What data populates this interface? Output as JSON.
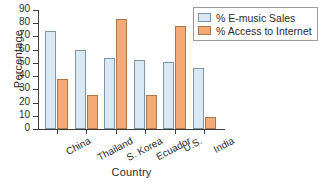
{
  "chart_data": {
    "type": "bar",
    "title": "",
    "xlabel": "Country",
    "ylabel": "Percentage",
    "categories": [
      "China",
      "Thailand",
      "S. Korea",
      "Ecuador",
      "U.S.",
      "India"
    ],
    "series": [
      {
        "name": "% E-music Sales",
        "color": "#d9e8f2",
        "edge_color": "#7d94a3",
        "values": [
          74,
          60,
          54,
          52,
          51,
          46
        ]
      },
      {
        "name": "% Access to Internet",
        "color": "#f2ab77",
        "edge_color": "#b0764a",
        "values": [
          38,
          26,
          83,
          26,
          78,
          9
        ]
      }
    ],
    "ylim": [
      0,
      90
    ],
    "yticks": [
      0,
      10,
      20,
      30,
      40,
      50,
      60,
      70,
      80,
      90
    ],
    "ytick_labels": [
      "0",
      "10",
      "20",
      "30",
      "40",
      "50",
      "60",
      "70",
      "80",
      "90"
    ],
    "grid": false,
    "legend_position": "upper right",
    "xtick_rotation": -28
  },
  "legend": {
    "items": [
      {
        "label": "% E-music Sales",
        "swatch": "legend-swatch-emusic"
      },
      {
        "label": "% Access to Internet",
        "swatch": "legend-swatch-internet"
      }
    ]
  }
}
